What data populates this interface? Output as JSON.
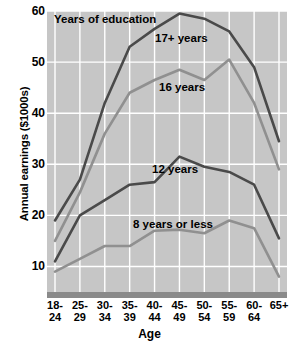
{
  "chart_data": {
    "type": "line",
    "title": "Years of education",
    "xlabel": "Age",
    "ylabel": "Annual earnings ($1000s)",
    "categories": [
      "18-24",
      "25-29",
      "30-34",
      "35-39",
      "40-44",
      "45-49",
      "50-54",
      "55-59",
      "60-64",
      "65+"
    ],
    "categories_lines": [
      [
        "18-",
        "24"
      ],
      [
        "25-",
        "29"
      ],
      [
        "30-",
        "34"
      ],
      [
        "35-",
        "39"
      ],
      [
        "40-",
        "44"
      ],
      [
        "45-",
        "49"
      ],
      [
        "50-",
        "54"
      ],
      [
        "55-",
        "59"
      ],
      [
        "60-",
        "64"
      ],
      [
        "65+",
        ""
      ]
    ],
    "ylim": [
      5,
      60
    ],
    "yticks": [
      10,
      20,
      30,
      40,
      50,
      60
    ],
    "grid": true,
    "legend": "inline-annotations",
    "series": [
      {
        "name": "17+ years",
        "color": "#4a4a4a",
        "values": [
          19,
          27,
          42,
          53,
          56.5,
          59.5,
          58.5,
          56,
          49,
          34.5
        ]
      },
      {
        "name": "16 years",
        "color": "#909090",
        "values": [
          15,
          24.5,
          36,
          44,
          46.5,
          48.5,
          46.5,
          50.5,
          42,
          29
        ]
      },
      {
        "name": "12 years",
        "color": "#4a4a4a",
        "values": [
          11,
          20,
          23,
          26,
          26.5,
          31.5,
          29.5,
          28.5,
          26,
          15.5
        ]
      },
      {
        "name": "8 years or less",
        "color": "#909090",
        "values": [
          9,
          11.5,
          14,
          14,
          17,
          17.2,
          16.5,
          19,
          17.5,
          8
        ]
      }
    ],
    "annotations": [
      {
        "label": "17+ years"
      },
      {
        "label": "16 years"
      },
      {
        "label": "12 years"
      },
      {
        "label": "8 years or less"
      }
    ],
    "plot_background": "#c6c6c6",
    "gridline_color": "#ffffff"
  }
}
